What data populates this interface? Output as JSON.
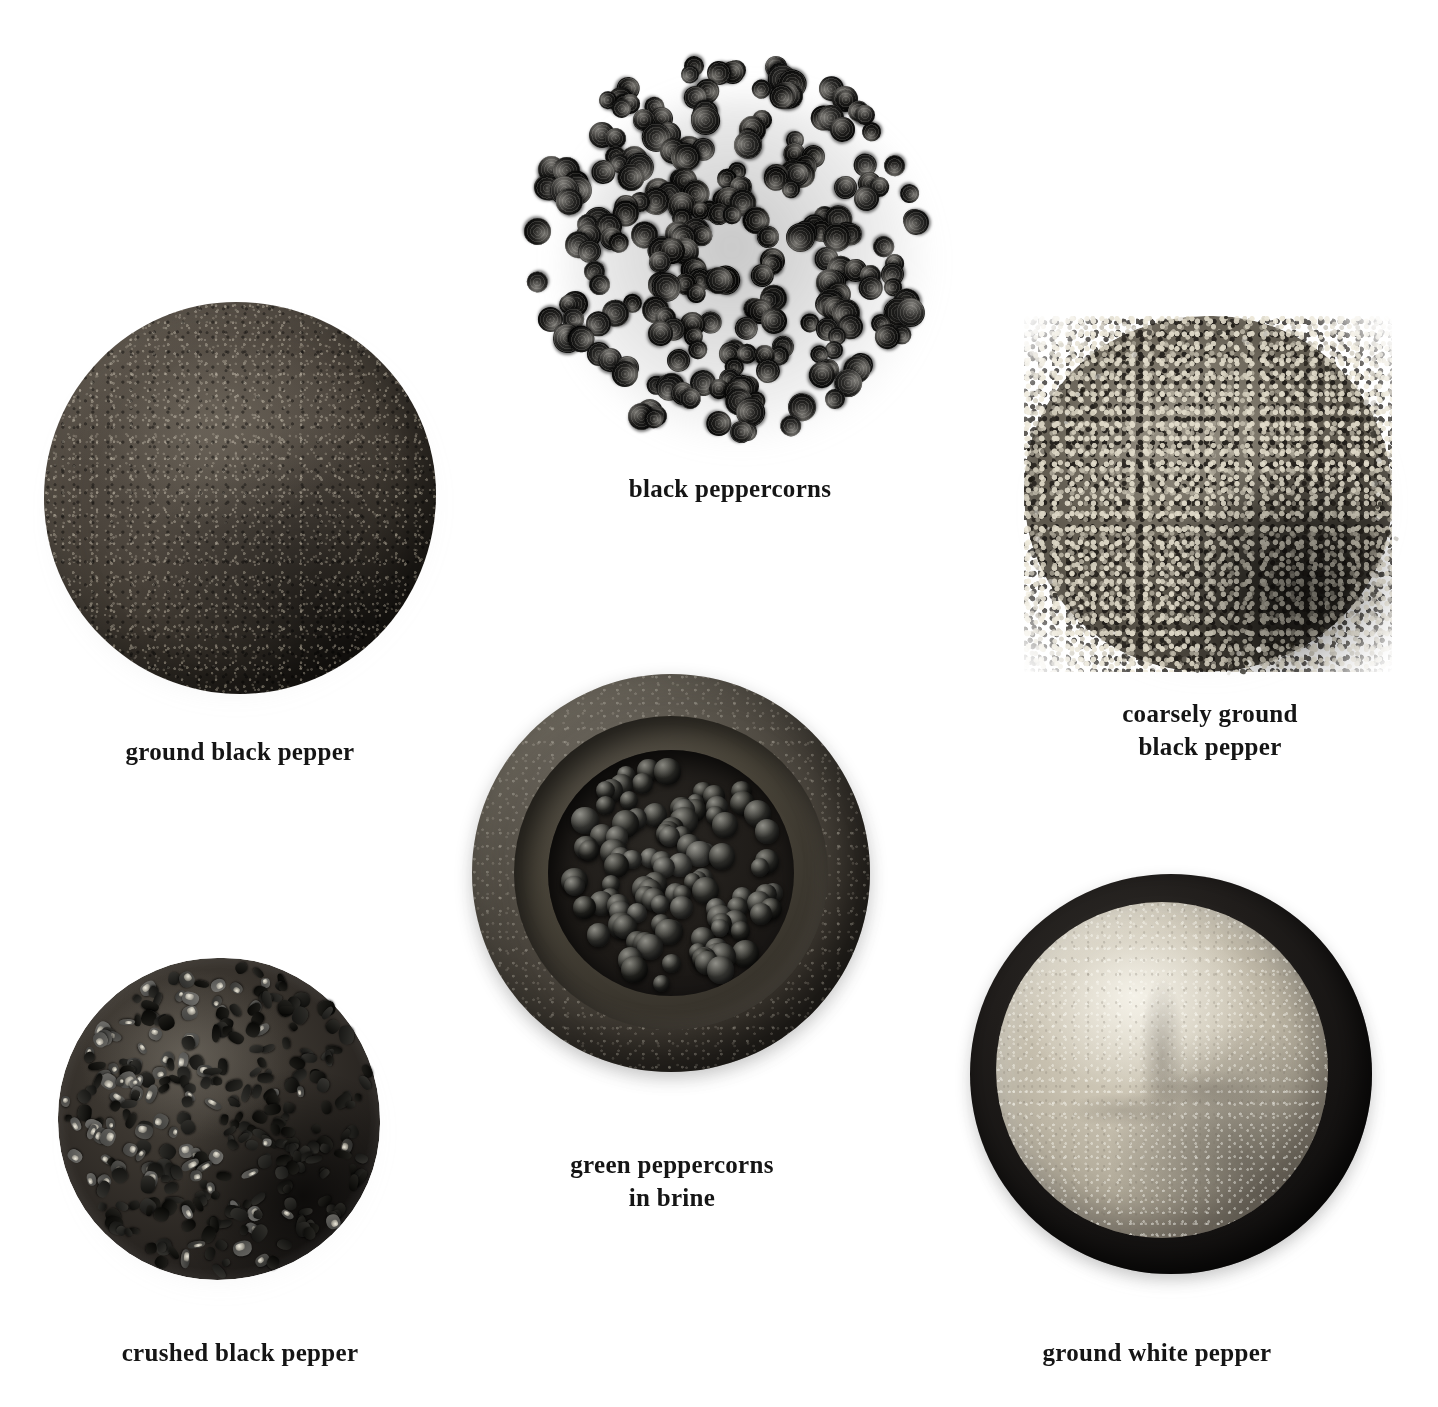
{
  "page": {
    "background_color": "#ffffff",
    "caption_color": "#151515"
  },
  "specimens": [
    {
      "id": "ground-black-pepper",
      "label": "ground black pepper",
      "form": "fine powder heap",
      "color": "#4c453d"
    },
    {
      "id": "black-peppercorns",
      "label": "black peppercorns",
      "form": "whole dried berries heap",
      "color": "#1d1a18"
    },
    {
      "id": "coarsely-ground-black-pepper",
      "label": "coarsely ground\nblack pepper",
      "form": "coarse speckled grains heap",
      "color": "#6a6458"
    },
    {
      "id": "green-peppercorns-in-brine",
      "label": "green peppercorns\nin brine",
      "form": "berries in stone mortar bowl",
      "color": "#3a352e"
    },
    {
      "id": "crushed-black-pepper",
      "label": "crushed black pepper",
      "form": "cracked fragments heap",
      "color": "#2a2622"
    },
    {
      "id": "ground-white-pepper",
      "label": "ground white pepper",
      "form": "pale powder in black dish",
      "color": "#c9c2b1"
    }
  ]
}
